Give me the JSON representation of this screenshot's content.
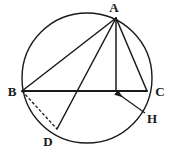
{
  "figure": {
    "type": "circle-geometry-diagram",
    "canvas": {
      "width": 171,
      "height": 150,
      "background": "#ffffff"
    },
    "stroke_color": "#1a1a1a",
    "label_color": "#1a1a1a",
    "circle": {
      "name": "circumcircle",
      "cx": 87,
      "cy": 78,
      "r": 65,
      "stroke_width": 1.4
    },
    "points": {
      "A": {
        "x": 116,
        "y": 18
      },
      "B": {
        "x": 22,
        "y": 91
      },
      "C": {
        "x": 147,
        "y": 91
      },
      "D": {
        "x": 57,
        "y": 129
      },
      "H": {
        "x": 116,
        "y": 91
      }
    },
    "labels": [
      {
        "id": "A",
        "text": "A",
        "x": 114,
        "y": 12,
        "anchor": "middle"
      },
      {
        "id": "B",
        "text": "B",
        "x": 12,
        "y": 96,
        "anchor": "middle"
      },
      {
        "id": "C",
        "text": "C",
        "x": 160,
        "y": 96,
        "anchor": "middle"
      },
      {
        "id": "D",
        "text": "D",
        "x": 48,
        "y": 146,
        "anchor": "middle"
      },
      {
        "id": "H",
        "text": "H",
        "x": 152,
        "y": 123,
        "anchor": "middle"
      }
    ],
    "segments": [
      {
        "id": "AB",
        "from": "A",
        "to": "B",
        "style": "solid",
        "width": 1.5
      },
      {
        "id": "AC",
        "from": "A",
        "to": "C",
        "style": "solid",
        "width": 1.5
      },
      {
        "id": "AD",
        "from": "A",
        "to": "D",
        "style": "solid",
        "width": 1.5
      },
      {
        "id": "AH",
        "from": "A",
        "to": "H",
        "style": "solid",
        "width": 1.5
      },
      {
        "id": "BC",
        "from": "B",
        "to": "C",
        "style": "solid",
        "width": 1.8
      },
      {
        "id": "BD",
        "from": "B",
        "to": "D",
        "style": "dashed",
        "width": 1.3,
        "dash": "3,2"
      }
    ],
    "leader": {
      "id": "H-leader",
      "from": {
        "x": 145,
        "y": 113
      },
      "to": {
        "x": 117,
        "y": 93
      },
      "arrow": "at-end",
      "width": 1.2
    }
  }
}
